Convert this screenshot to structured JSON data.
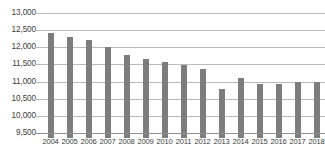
{
  "chart_data": {
    "type": "bar",
    "title": "",
    "subtitle": "",
    "xlabel": "",
    "ylabel": "",
    "categories": [
      "2004",
      "2005",
      "2006",
      "2007",
      "2008",
      "2009",
      "2010",
      "2011",
      "2012",
      "2013",
      "2014",
      "2015",
      "2016",
      "2017",
      "2018"
    ],
    "values": [
      12420,
      12300,
      12200,
      12020,
      11780,
      11670,
      11580,
      11490,
      11370,
      10780,
      11100,
      10940,
      10940,
      10990,
      10990
    ],
    "series": [
      {
        "name": "",
        "values": [
          12420,
          12300,
          12200,
          12020,
          11780,
          11670,
          11580,
          11490,
          11370,
          10780,
          11100,
          10940,
          10940,
          10990,
          10990
        ]
      }
    ],
    "ylim": [
      9500,
      13000
    ],
    "ytick_step": 500,
    "ytick_labels": [
      "13,000",
      "12,500",
      "12,000",
      "11,500",
      "11,000",
      "10,500",
      "10,000",
      "9,500"
    ],
    "ytick_values": [
      13000,
      12500,
      12000,
      11500,
      11000,
      10500,
      10000,
      9500
    ],
    "xtick_labels": [
      "2004",
      "2005",
      "2006",
      "2007",
      "2008",
      "2009",
      "2010",
      "2011",
      "2012",
      "2013",
      "2014",
      "2015",
      "2016",
      "2017",
      "2018"
    ],
    "grid": true,
    "grid_axis": "y",
    "legend": false,
    "legend_position": "none",
    "bar_color": "#7d7d7d",
    "gridline_color": "#b9b9b9",
    "axis_color": "#8f8f8f",
    "text_color": "#3d3d3d",
    "background_color": "#ffffff"
  }
}
